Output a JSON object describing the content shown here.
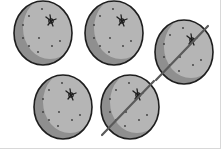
{
  "illustration": {
    "subject": "oranges",
    "total_count": 5,
    "crossed_out_count": 2,
    "remaining_count": 3,
    "colors": {
      "outline": "#1e1e1e",
      "shadow": "#8f8f8f",
      "highlight": "#b5b5b5",
      "dots": "#3a3a3a",
      "strike": "#5a5a5a"
    },
    "items": [
      {
        "cx": 43,
        "cy": 33,
        "rx": 29,
        "ry": 32,
        "crossed": false
      },
      {
        "cx": 114,
        "cy": 33,
        "rx": 29,
        "ry": 32,
        "crossed": false
      },
      {
        "cx": 184,
        "cy": 52,
        "rx": 29,
        "ry": 32,
        "crossed": true
      },
      {
        "cx": 63,
        "cy": 107,
        "rx": 29,
        "ry": 32,
        "crossed": false
      },
      {
        "cx": 130,
        "cy": 107,
        "rx": 29,
        "ry": 32,
        "crossed": true
      }
    ]
  }
}
